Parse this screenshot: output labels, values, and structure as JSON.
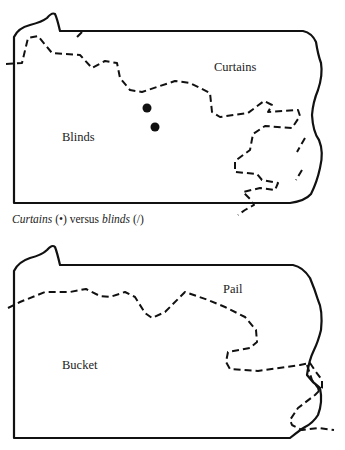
{
  "figure": {
    "maps": [
      {
        "id": "top",
        "region": "Pennsylvania",
        "labels": {
          "north": "Curtains",
          "south": "Blinds"
        },
        "markers": [
          {
            "symbol": "dot",
            "x": 147,
            "y": 108
          },
          {
            "symbol": "dot",
            "x": 155,
            "y": 127
          }
        ]
      },
      {
        "id": "bottom",
        "region": "Pennsylvania",
        "labels": {
          "north": "Pail",
          "south": "Bucket"
        }
      }
    ],
    "caption": {
      "term1": "Curtains",
      "symbol1": "(•)",
      "versus": "versus",
      "term2": "blinds",
      "symbol2": "(/)"
    }
  }
}
